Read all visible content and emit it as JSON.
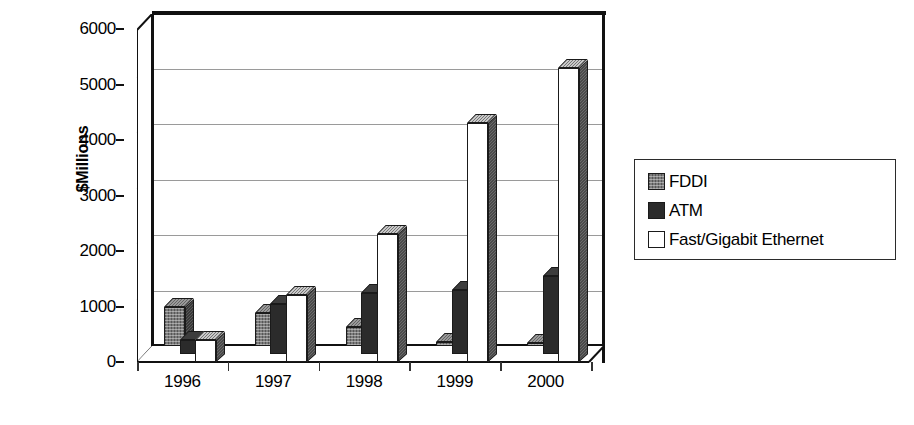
{
  "chart_data": {
    "type": "bar",
    "title": "",
    "subtitle": "",
    "xlabel": "",
    "ylabel": "$Millions",
    "categories": [
      "1996",
      "1997",
      "1998",
      "1999",
      "2000"
    ],
    "ylim": [
      0,
      6000
    ],
    "ytick_labels": [
      "0",
      "1000",
      "2000",
      "3000",
      "4000",
      "5000",
      "6000"
    ],
    "ytick_values": [
      0,
      1000,
      2000,
      3000,
      4000,
      5000,
      6000
    ],
    "grid": true,
    "legend_position": "right",
    "style": "3d-clustered-column",
    "series": [
      {
        "name": "FDDI",
        "swatch": "#7d7d7d",
        "values": [
          700,
          600,
          350,
          80,
          60
        ]
      },
      {
        "name": "ATM",
        "swatch": "#2b2b2b",
        "values": [
          250,
          900,
          1100,
          1150,
          1400
        ]
      },
      {
        "name": "Fast/Gigabit Ethernet",
        "swatch": "#ffffff",
        "values": [
          400,
          1200,
          2300,
          4300,
          5300
        ]
      }
    ]
  },
  "axes": {
    "y_title": "$Millions",
    "y_ticks": [
      "6000",
      "5000",
      "4000",
      "3000",
      "2000",
      "1000",
      "0"
    ],
    "x_ticks": [
      "1996",
      "1997",
      "1998",
      "1999",
      "2000"
    ]
  },
  "legend": {
    "items": [
      {
        "label": "FDDI",
        "color": "#7d7d7d"
      },
      {
        "label": "ATM",
        "color": "#2b2b2b"
      },
      {
        "label": "Fast/Gigabit Ethernet",
        "color": "#ffffff"
      }
    ]
  }
}
